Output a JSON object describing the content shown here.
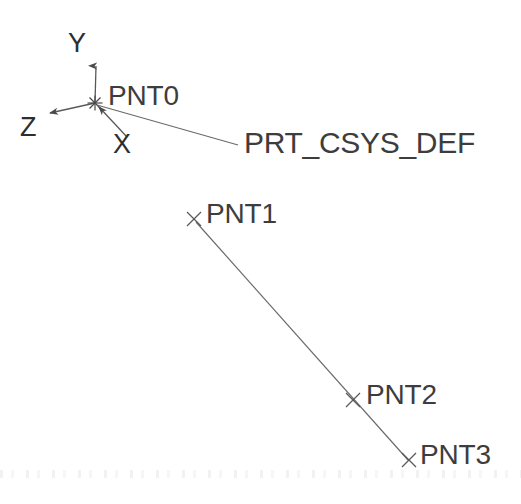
{
  "view": {
    "background_color": "#ffffff",
    "line_color": "#555555",
    "text_color": "#3d3d3d",
    "width": 521,
    "height": 504
  },
  "coordinate_system": {
    "name_label": "PRT_CSYS_DEF",
    "origin": {
      "x": 95,
      "y": 103
    },
    "origin_marker": "asterisk-csys-marker",
    "leader_end": {
      "x": 238,
      "y": 145
    },
    "label_position": {
      "x": 244,
      "y": 128
    },
    "axes": [
      {
        "id": "y",
        "label": "Y",
        "label_position": {
          "x": 68,
          "y": 30
        },
        "tip": {
          "x": 96,
          "y": 60
        },
        "arrow_direction": "up"
      },
      {
        "id": "z",
        "label": "Z",
        "label_position": {
          "x": 20,
          "y": 114
        },
        "tip": {
          "x": 48,
          "y": 113
        },
        "arrow_direction": "down-left"
      },
      {
        "id": "x",
        "label": "X",
        "label_position": {
          "x": 113,
          "y": 131
        },
        "tip": {
          "x": 127,
          "y": 137
        },
        "arrow_direction": "up-left-into-origin"
      }
    ]
  },
  "datum_points": [
    {
      "id": "pnt0",
      "label": "PNT0",
      "marker": "csys-origin-cross",
      "marker_position": {
        "x": 95,
        "y": 103
      },
      "label_position": {
        "x": 108,
        "y": 82
      },
      "has_marker": false
    },
    {
      "id": "pnt1",
      "label": "PNT1",
      "marker": "x-cross-marker",
      "marker_position": {
        "x": 194,
        "y": 219
      },
      "label_position": {
        "x": 206,
        "y": 200
      },
      "has_marker": true
    },
    {
      "id": "pnt2",
      "label": "PNT2",
      "marker": "x-cross-marker",
      "marker_position": {
        "x": 353,
        "y": 400
      },
      "label_position": {
        "x": 366,
        "y": 381
      },
      "has_marker": true
    },
    {
      "id": "pnt3",
      "label": "PNT3",
      "marker": "x-cross-marker",
      "marker_position": {
        "x": 409,
        "y": 460
      },
      "label_position": {
        "x": 420,
        "y": 441
      },
      "has_marker": true
    }
  ],
  "datum_curve": {
    "id": "line-pnt1-pnt3",
    "type": "straight-line",
    "from": "PNT1",
    "through": "PNT2",
    "to": "PNT3",
    "start": {
      "x": 196,
      "y": 222
    },
    "end": {
      "x": 408,
      "y": 460
    }
  }
}
